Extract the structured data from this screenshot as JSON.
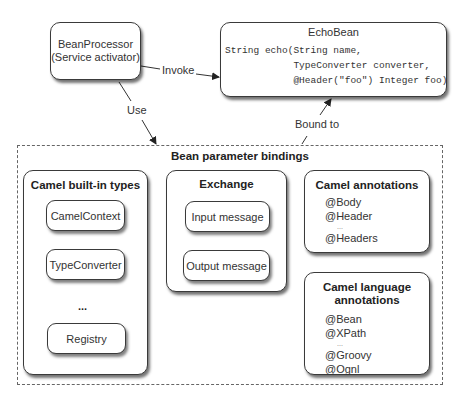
{
  "bean_processor": {
    "line1": "BeanProcessor",
    "line2": "(Service activator)"
  },
  "echo_bean": {
    "title": "EchoBean",
    "code": [
      "String echo(String name,",
      "            TypeConverter converter,",
      "            @Header(\"foo\") Integer foo)"
    ]
  },
  "edges": {
    "invoke": "Invoke",
    "use": "Use",
    "bound_to": "Bound to"
  },
  "bindings": {
    "title": "Bean parameter bindings",
    "builtin": {
      "title": "Camel built-in types",
      "items": [
        "CamelContext",
        "TypeConverter",
        "Registry"
      ],
      "ellipsis": "..."
    },
    "exchange": {
      "title": "Exchange",
      "items": [
        "Input message",
        "Output message"
      ]
    },
    "annotations": {
      "title": "Camel annotations",
      "items": [
        "@Body",
        "@Header",
        "...",
        "@Headers"
      ]
    },
    "language": {
      "title_line1": "Camel language",
      "title_line2": "annotations",
      "items": [
        "@Bean",
        "@XPath",
        "...",
        "@Groovy",
        "@Ognl"
      ]
    }
  }
}
